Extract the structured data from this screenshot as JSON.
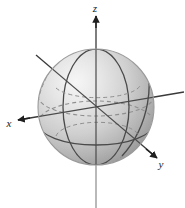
{
  "figure": {
    "background_color": "#ffffff",
    "width": 185,
    "height": 208
  },
  "axes": {
    "x": {
      "label": "x",
      "label_position": {
        "x": 9,
        "y": 127
      },
      "arrow_direction": "left-down",
      "arrow_tip": {
        "x": 18,
        "y": 120
      },
      "line_start": {
        "x": 18,
        "y": 120
      },
      "line_end": {
        "x": 184,
        "y": 92
      },
      "color": "#2b2b2b"
    },
    "y": {
      "label": "y",
      "label_position": {
        "x": 160,
        "y": 166
      },
      "arrow_direction": "right-down",
      "arrow_tip": {
        "x": 156,
        "y": 157
      },
      "line_start": {
        "x": 156,
        "y": 157
      },
      "line_end": {
        "x": 36,
        "y": 55
      },
      "color": "#2b2b2b"
    },
    "z": {
      "label": "z",
      "label_position": {
        "x": 94,
        "y": 12
      },
      "arrow_direction": "up",
      "arrow_tip": {
        "x": 96,
        "y": 16
      },
      "line_start": {
        "x": 96,
        "y": 16
      },
      "line_end": {
        "x": 96,
        "y": 208
      },
      "color": "#2b2b2b",
      "below_sphere_color": "#a8a8a8"
    },
    "origin": {
      "x": 96,
      "y": 107
    }
  },
  "sphere": {
    "center": {
      "x": 96,
      "y": 107
    },
    "radius": 58,
    "fill_light": "#f2f2f2",
    "fill_mid": "#d6d6d6",
    "fill_dark": "#9d9d9d",
    "outline_color": "#9a9a9a",
    "highlight_position": "upper-left",
    "solid_curve_color": "#4a4a4a",
    "dashed_curve_color": "#8f8f8f",
    "curves": [
      {
        "name": "meridian-front-vertical",
        "style": "solid"
      },
      {
        "name": "meridian-tilted",
        "style": "solid"
      },
      {
        "name": "equator-front",
        "style": "solid"
      },
      {
        "name": "equator-back",
        "style": "dashed"
      },
      {
        "name": "meridian-back-hidden",
        "style": "dashed"
      },
      {
        "name": "latitude-upper-hidden",
        "style": "dashed"
      }
    ]
  }
}
